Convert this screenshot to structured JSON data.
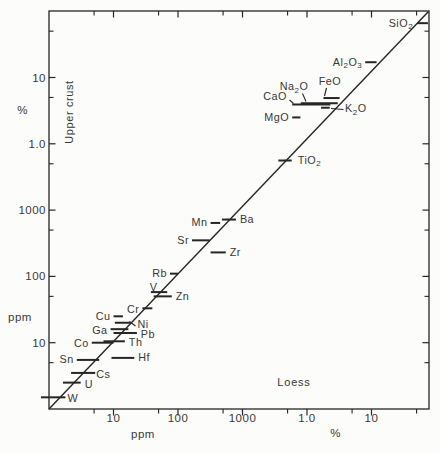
{
  "figure": {
    "background": "#fcfcfa",
    "ink_line": "#262626",
    "ink_text": "#383838"
  },
  "chart_data": {
    "type": "scatter",
    "title": "",
    "x_variable_label": "Loess",
    "y_variable_label": "Upper crust",
    "scales": "log-log, ppm rising to % on both axes, identity (1:1) line shown",
    "x_axis": {
      "unit_label_ppm": "ppm",
      "unit_label_pct": "%",
      "major_ticks": [
        {
          "value_ppm": 10,
          "label": "10"
        },
        {
          "value_ppm": 100,
          "label": "100"
        },
        {
          "value_ppm": 1000,
          "label": "1000"
        },
        {
          "value_ppm": 10000,
          "label": "1.0"
        },
        {
          "value_ppm": 100000,
          "label": "10"
        }
      ],
      "minor_ticks_ppm": [
        5,
        50,
        500,
        5000,
        50000,
        500000
      ]
    },
    "y_axis": {
      "unit_label_ppm": "ppm",
      "unit_label_pct": "%",
      "major_ticks": [
        {
          "value_ppm": 10,
          "label": "10"
        },
        {
          "value_ppm": 100,
          "label": "100"
        },
        {
          "value_ppm": 1000,
          "label": "1000"
        },
        {
          "value_ppm": 10000,
          "label": "1.0"
        },
        {
          "value_ppm": 100000,
          "label": "10"
        }
      ],
      "minor_ticks_ppm": [
        5,
        50,
        500,
        5000,
        50000,
        500000
      ]
    },
    "identity_line": true,
    "series_note": "each element: horizontal bar = loess concentration range (x), plotted at upper-crust concentration (y); all values ppm",
    "elements": [
      {
        "sym": "SiO2",
        "loess": [
          510000,
          750000
        ],
        "crust": 660000,
        "label": {
          "side": "left",
          "dx": -1
        }
      },
      {
        "sym": "Al2O3",
        "loess": [
          80000,
          120000
        ],
        "crust": 170000,
        "label": {
          "side": "left"
        }
      },
      {
        "sym": "FeO",
        "loess": [
          18000,
          32000
        ],
        "crust": 49000,
        "label": {
          "px": [
            330,
            85
          ],
          "anchor": "middle"
        },
        "leader": [
          326.5,
          88,
          324.5,
          96
        ]
      },
      {
        "sym": "Na2O",
        "loess": [
          8000,
          30000
        ],
        "crust": 41000,
        "label": {
          "px": [
            294,
            90
          ],
          "anchor": "middle"
        },
        "leader": [
          302.5,
          93.5,
          306,
          101.5
        ]
      },
      {
        "sym": "CaO",
        "loess": [
          5900,
          23000
        ],
        "crust": 39000,
        "label": {
          "px": [
            275,
            100
          ],
          "anchor": "middle"
        },
        "leader": [
          289.5,
          100,
          293.5,
          103.5
        ]
      },
      {
        "sym": "K2O",
        "loess": [
          16500,
          22500
        ],
        "crust": 35000,
        "label": {
          "px": [
            345,
            112
          ],
          "anchor": "start"
        },
        "leader": [
          331,
          108.5,
          343.5,
          109.5
        ]
      },
      {
        "sym": "MgO",
        "loess": [
          5900,
          7900
        ],
        "crust": 25000,
        "label": {
          "side": "left"
        }
      },
      {
        "sym": "TiO2",
        "loess": [
          3600,
          5800
        ],
        "crust": 5600,
        "label": {
          "side": "right",
          "dx": 2
        }
      },
      {
        "sym": "Ba",
        "loess": [
          480,
          790
        ],
        "crust": 720,
        "label": {
          "side": "right"
        }
      },
      {
        "sym": "Mn",
        "loess": [
          320,
          450
        ],
        "crust": 640,
        "label": {
          "side": "left"
        }
      },
      {
        "sym": "Sr",
        "loess": [
          165,
          310
        ],
        "crust": 350,
        "label": {
          "side": "left"
        }
      },
      {
        "sym": "Zr",
        "loess": [
          320,
          550
        ],
        "crust": 230,
        "label": {
          "side": "right"
        }
      },
      {
        "sym": "Rb",
        "loess": [
          75,
          100
        ],
        "crust": 110,
        "label": {
          "side": "left"
        }
      },
      {
        "sym": "V",
        "loess": [
          38,
          68
        ],
        "crust": 58,
        "label": {
          "px": [
            153.5,
            290.5
          ],
          "anchor": "middle"
        }
      },
      {
        "sym": "Zn",
        "loess": [
          42,
          80
        ],
        "crust": 50,
        "label": {
          "side": "right"
        }
      },
      {
        "sym": "Cr",
        "loess": [
          28,
          40
        ],
        "crust": 33,
        "label": {
          "side": "left",
          "dy": 1
        }
      },
      {
        "sym": "Cu",
        "loess": [
          10,
          14
        ],
        "crust": 25,
        "label": {
          "side": "left"
        }
      },
      {
        "sym": "Ni",
        "loess": [
          10.5,
          18
        ],
        "crust": 20,
        "label": {
          "px": [
            137.5,
            328
          ],
          "anchor": "start"
        },
        "leader": [
          129.5,
          321.5,
          135.5,
          326
        ]
      },
      {
        "sym": "Ga",
        "loess": [
          9,
          17
        ],
        "crust": 16,
        "label": {
          "side": "left",
          "dy": 1
        }
      },
      {
        "sym": "Pb",
        "loess": [
          10,
          23
        ],
        "crust": 14,
        "label": {
          "side": "right",
          "dy": 1.5
        }
      },
      {
        "sym": "Co",
        "loess": [
          4.6,
          10
        ],
        "crust": 10,
        "label": {
          "side": "left",
          "dy": 1
        }
      },
      {
        "sym": "Th",
        "loess": [
          7,
          15
        ],
        "crust": 10.5,
        "label": {
          "side": "right",
          "dy": 1.5
        }
      },
      {
        "sym": "Sn",
        "loess": [
          2.7,
          6
        ],
        "crust": 5.5,
        "label": {
          "side": "left"
        }
      },
      {
        "sym": "Hf",
        "loess": [
          9.3,
          21
        ],
        "crust": 5.9,
        "label": {
          "side": "right"
        }
      },
      {
        "sym": "Cs",
        "loess": [
          2.2,
          5.2
        ],
        "crust": 3.5,
        "label": {
          "side": "right",
          "dx": -3,
          "dy": 1.5
        }
      },
      {
        "sym": "U",
        "loess": [
          1.65,
          3.1
        ],
        "crust": 2.5,
        "label": {
          "side": "right",
          "dy": 1.5
        }
      },
      {
        "sym": "W",
        "loess": [
          0.75,
          1.8
        ],
        "crust": 1.5,
        "label": {
          "side": "right",
          "dx": -2,
          "dy": 1
        }
      }
    ],
    "layout": {
      "plot": {
        "left": 49,
        "top": 11,
        "right": 429,
        "bottom": 409
      },
      "px_per_decade_x": 64.5,
      "px_per_decade_y": 66.3,
      "y_pct_unit_pos": [
        22.5,
        114
      ],
      "y_ppm_unit_pos": [
        20,
        321
      ],
      "x_ppm_unit_pos": [
        143,
        438
      ],
      "x_pct_unit_pos": [
        335.5,
        437
      ],
      "y_variable_pos": [
        73,
        112
      ],
      "x_variable_pos": [
        294,
        386
      ],
      "bar_stroke": 2,
      "tick_major_len": 6.5,
      "tick_minor_len": 4.5
    }
  }
}
